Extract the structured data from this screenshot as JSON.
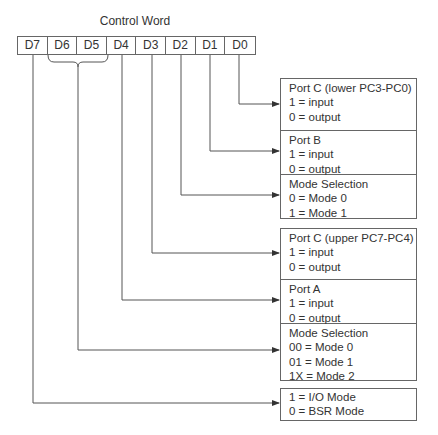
{
  "title": "Control Word",
  "bits": [
    "D7",
    "D6",
    "D5",
    "D4",
    "D3",
    "D2",
    "D1",
    "D0"
  ],
  "groups": [
    {
      "cells": [
        {
          "lines": [
            "Port C (lower PC3-PC0)",
            "1 = input",
            "0 = output"
          ],
          "from_bit": "D0"
        },
        {
          "lines": [
            "Port B",
            "1 = input",
            "0 = output"
          ],
          "from_bit": "D1"
        },
        {
          "lines": [
            "Mode Selection",
            "0 = Mode 0",
            "1 = Mode 1"
          ],
          "from_bit": "D2"
        }
      ]
    },
    {
      "cells": [
        {
          "lines": [
            "Port C (upper PC7-PC4)",
            "1 = input",
            "0 = output"
          ],
          "from_bit": "D3"
        },
        {
          "lines": [
            "Port A",
            "1 = input",
            "0 = output"
          ],
          "from_bit": "D4"
        },
        {
          "lines": [
            "Mode Selection",
            "00 = Mode 0",
            "01 = Mode 1",
            "1X = Mode 2"
          ],
          "from_bit": "D6-D5"
        }
      ]
    },
    {
      "cells": [
        {
          "lines": [
            "1 = I/O Mode",
            "0 = BSR Mode"
          ],
          "from_bit": "D7"
        }
      ]
    }
  ]
}
